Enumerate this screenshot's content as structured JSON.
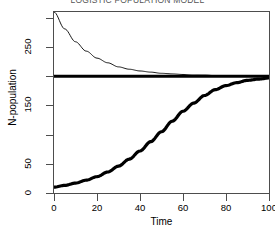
{
  "chart_data": {
    "type": "line",
    "title": "LOGISTIC POPULATION MODEL",
    "xlabel": "Time",
    "ylabel": "N-population",
    "xlim": [
      0,
      100
    ],
    "ylim": [
      0,
      310
    ],
    "grid": false,
    "legend": "none",
    "xticks": [
      0,
      20,
      40,
      60,
      80,
      100
    ],
    "yticks": [
      0,
      50,
      150,
      250
    ],
    "ytick_labels": [
      "0",
      "50",
      "150",
      "250"
    ],
    "xtick_labels": [
      "0",
      "20",
      "40",
      "60",
      "80",
      "100"
    ],
    "carrying_capacity": 200,
    "series": [
      {
        "name": "logistic-growth-below-K",
        "style": "thick",
        "x": [
          0,
          5,
          10,
          15,
          20,
          25,
          30,
          35,
          40,
          45,
          50,
          55,
          60,
          65,
          70,
          75,
          80,
          85,
          90,
          95,
          100
        ],
        "values": [
          10,
          13,
          17,
          22,
          28,
          36,
          46,
          58,
          72,
          88,
          105,
          123,
          140,
          154,
          167,
          177,
          184,
          189,
          193,
          195,
          197
        ]
      },
      {
        "name": "exponential-decay-above-K",
        "style": "thin",
        "x": [
          0,
          5,
          10,
          15,
          20,
          25,
          30,
          35,
          40,
          45,
          50,
          55,
          60,
          65,
          70,
          75,
          80,
          85,
          90,
          95,
          100
        ],
        "values": [
          310,
          281,
          259,
          243,
          231,
          223,
          216,
          212,
          209,
          207,
          205,
          204,
          203,
          202,
          202,
          201,
          201,
          201,
          200,
          200,
          200
        ]
      },
      {
        "name": "carrying-capacity-asymptote",
        "style": "thick",
        "x": [
          0,
          100
        ],
        "values": [
          200,
          200
        ]
      }
    ]
  },
  "axis": {
    "y_title": "N-population",
    "x_title": "Time"
  },
  "colors": {
    "line": "#000000",
    "axis": "#4d4d4d",
    "background": "#ffffff",
    "title": "#555555"
  }
}
